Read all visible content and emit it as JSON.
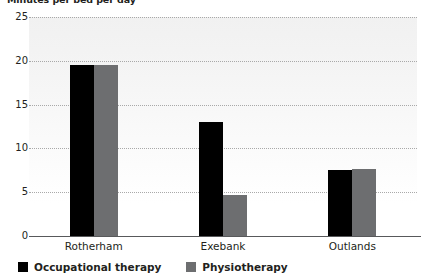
{
  "chart_data": {
    "type": "bar",
    "title": "Minutes per bed per day",
    "xlabel": "",
    "ylabel": "",
    "ylim": [
      0,
      25
    ],
    "yticks": [
      0,
      5,
      10,
      15,
      20,
      25
    ],
    "grid": true,
    "legend_position": "bottom-left",
    "categories": [
      "Rotherham",
      "Exebank",
      "Outlands"
    ],
    "series": [
      {
        "name": "Occupational therapy",
        "color": "#000000",
        "values": [
          19.5,
          13.0,
          7.5
        ]
      },
      {
        "name": "Physiotherapy",
        "color": "#6d6e70",
        "values": [
          19.5,
          4.7,
          7.6
        ]
      }
    ]
  },
  "axis": {
    "y_tick_labels": [
      "0",
      "5",
      "10",
      "15",
      "20",
      "25"
    ]
  }
}
